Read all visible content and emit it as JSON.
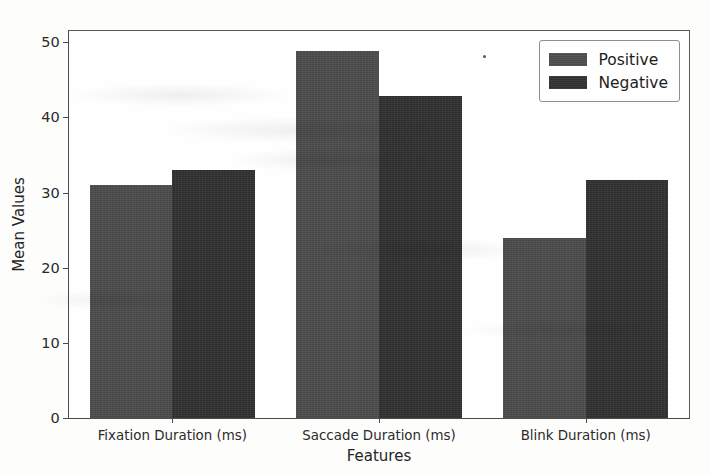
{
  "chart_data": {
    "type": "bar",
    "title": "",
    "xlabel": "Features",
    "ylabel": "Mean Values",
    "categories": [
      "Fixation Duration (ms)",
      "Saccade Duration (ms)",
      "Blink Duration (ms)"
    ],
    "series": [
      {
        "name": "Positive",
        "color": "#4a4a4a",
        "values": [
          31.0,
          48.8,
          24.0
        ]
      },
      {
        "name": "Negative",
        "color": "#2f2f2f",
        "values": [
          33.0,
          42.8,
          31.7
        ]
      }
    ],
    "ylim": [
      0,
      51.5
    ],
    "yticks": [
      0,
      10,
      20,
      30,
      40,
      50
    ],
    "ytick_labels": [
      "0",
      "10",
      "20",
      "30",
      "40",
      "50"
    ],
    "grid": false,
    "legend_position": "upper right"
  },
  "legend": {
    "entries": [
      {
        "label": "Positive"
      },
      {
        "label": "Negative"
      }
    ]
  }
}
